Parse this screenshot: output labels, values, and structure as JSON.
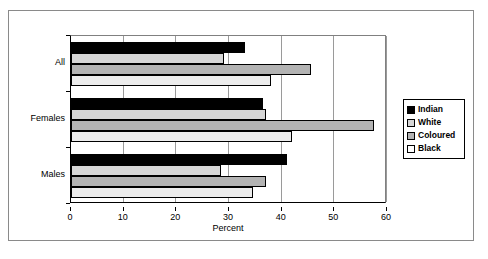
{
  "chart_data": {
    "type": "bar",
    "orientation": "horizontal",
    "title": "",
    "xlabel": "Percent",
    "ylabel": "",
    "xlim": [
      0,
      60
    ],
    "xticks": [
      0,
      10,
      20,
      30,
      40,
      50,
      60
    ],
    "grid": true,
    "legend_position": "right",
    "categories": [
      "All",
      "Females",
      "Males"
    ],
    "series": [
      {
        "name": "Indian",
        "color": "#000000",
        "values": [
          33.0,
          36.5,
          41.0
        ]
      },
      {
        "name": "White",
        "color": "#d6d6d6",
        "values": [
          29.0,
          37.0,
          28.5
        ]
      },
      {
        "name": "Coloured",
        "color": "#b3b3b3",
        "values": [
          45.5,
          57.5,
          37.0
        ]
      },
      {
        "name": "Black",
        "color": "#ffffff",
        "values": [
          38.0,
          42.0,
          34.5
        ]
      }
    ]
  },
  "legend": {
    "items": [
      {
        "label": "Indian"
      },
      {
        "label": "White"
      },
      {
        "label": "Coloured"
      },
      {
        "label": "Black"
      }
    ]
  },
  "axis": {
    "x_title": "Percent",
    "x_ticklabels": [
      "0",
      "10",
      "20",
      "30",
      "40",
      "50",
      "60"
    ],
    "y_ticklabels": [
      "All",
      "Females",
      "Males"
    ]
  }
}
